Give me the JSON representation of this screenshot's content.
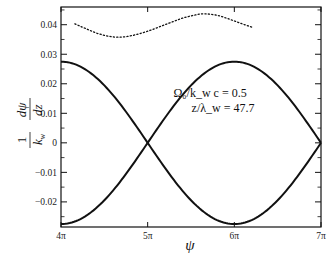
{
  "chart_data": {
    "type": "line",
    "title": "",
    "xlabel": "ψ",
    "ylabel": "1/k_w dψ/dz",
    "xlim_pi": [
      4,
      7
    ],
    "ylim": [
      -0.0285,
      0.046
    ],
    "x_ticks": [
      {
        "value_pi": 4,
        "label": "4π"
      },
      {
        "value_pi": 5,
        "label": "5π"
      },
      {
        "value_pi": 6,
        "label": "6π"
      },
      {
        "value_pi": 7,
        "label": "7π"
      }
    ],
    "y_ticks": [
      {
        "value": 0.04,
        "label": "0.04"
      },
      {
        "value": 0.03,
        "label": "0.03"
      },
      {
        "value": 0.02,
        "label": "0.02"
      },
      {
        "value": 0.01,
        "label": "0.01"
      },
      {
        "value": 0,
        "label": "0"
      },
      {
        "value": -0.01,
        "label": "-0.01"
      },
      {
        "value": -0.02,
        "label": "-0.02"
      }
    ],
    "y_minor_step": 0.005,
    "grid": false,
    "annotations": [
      {
        "text": "Ω₀/k_w c = 0.5",
        "x_pi": 5.72,
        "y": 0.0155
      },
      {
        "text": "z/λ_w = 47.7",
        "x_pi": 5.87,
        "y": 0.0105
      }
    ],
    "series": [
      {
        "name": "separatrix-upper-start",
        "style": "solid",
        "x_pi": [
          4.0,
          4.25,
          4.5,
          4.75,
          5.0,
          5.25,
          5.5,
          5.75,
          6.0,
          6.25,
          6.5,
          6.75,
          7.0
        ],
        "values": [
          0.0275,
          0.0254,
          0.0194,
          0.0105,
          0.0,
          -0.0105,
          -0.0194,
          -0.0254,
          -0.0275,
          -0.0254,
          -0.0194,
          -0.0105,
          0.0
        ]
      },
      {
        "name": "separatrix-lower-start",
        "style": "solid",
        "x_pi": [
          4.0,
          4.25,
          4.5,
          4.75,
          5.0,
          5.25,
          5.5,
          5.75,
          6.0,
          6.25,
          6.5,
          6.75,
          7.0
        ],
        "values": [
          -0.0275,
          -0.0254,
          -0.0194,
          -0.0105,
          0.0,
          0.0105,
          0.0194,
          0.0254,
          0.0275,
          0.0254,
          0.0194,
          0.0105,
          0.0
        ]
      },
      {
        "name": "electron-trajectory",
        "style": "dotted",
        "x_pi": [
          4.16,
          4.3,
          4.45,
          4.63,
          4.8,
          5.0,
          5.2,
          5.4,
          5.55,
          5.65,
          5.8,
          5.95,
          6.1,
          6.22
        ],
        "values": [
          0.0403,
          0.0385,
          0.0368,
          0.0358,
          0.0362,
          0.0378,
          0.04,
          0.0422,
          0.0433,
          0.0437,
          0.0432,
          0.0418,
          0.0402,
          0.039
        ]
      }
    ]
  }
}
